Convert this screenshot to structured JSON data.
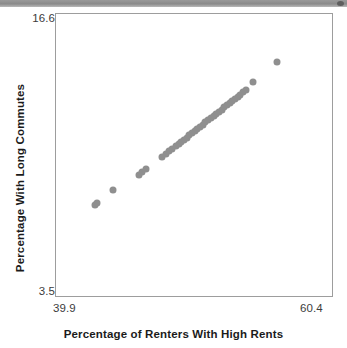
{
  "header": {
    "bar_color": "#8a8a8a",
    "marker_name": "window-dot"
  },
  "chart_data": {
    "type": "scatter",
    "title": "",
    "xlabel": "Percentage of Renters With High Rents",
    "ylabel": "Percentage With Long Commutes",
    "xlim": [
      39.9,
      60.4
    ],
    "ylim": [
      3.5,
      16.6
    ],
    "xticks": [
      "39.9",
      "60.4"
    ],
    "yticks": [
      "3.5",
      "16.6"
    ],
    "grid": false,
    "legend": null,
    "marker_color": "#8f8f8f",
    "marker_size": 7,
    "frame_color": "#9d9d9d",
    "points": [
      [
        42.8,
        7.72
      ],
      [
        42.95,
        7.82
      ],
      [
        44.15,
        8.42
      ],
      [
        46.05,
        9.12
      ],
      [
        46.3,
        9.28
      ],
      [
        46.55,
        9.42
      ],
      [
        47.8,
        9.98
      ],
      [
        48.05,
        10.1
      ],
      [
        48.3,
        10.22
      ],
      [
        48.55,
        10.34
      ],
      [
        48.8,
        10.46
      ],
      [
        49.0,
        10.56
      ],
      [
        49.2,
        10.66
      ],
      [
        49.4,
        10.76
      ],
      [
        49.6,
        10.86
      ],
      [
        49.8,
        10.96
      ],
      [
        50.0,
        11.06
      ],
      [
        50.2,
        11.16
      ],
      [
        50.4,
        11.26
      ],
      [
        50.6,
        11.36
      ],
      [
        50.8,
        11.46
      ],
      [
        51.0,
        11.56
      ],
      [
        51.2,
        11.66
      ],
      [
        51.4,
        11.76
      ],
      [
        51.6,
        11.86
      ],
      [
        51.8,
        11.96
      ],
      [
        52.0,
        12.06
      ],
      [
        52.2,
        12.16
      ],
      [
        52.4,
        12.26
      ],
      [
        52.6,
        12.36
      ],
      [
        52.8,
        12.46
      ],
      [
        53.0,
        12.56
      ],
      [
        53.2,
        12.66
      ],
      [
        53.4,
        12.76
      ],
      [
        53.6,
        12.86
      ],
      [
        53.8,
        12.96
      ],
      [
        54.0,
        13.06
      ],
      [
        54.55,
        13.42
      ],
      [
        56.35,
        14.38
      ]
    ]
  }
}
